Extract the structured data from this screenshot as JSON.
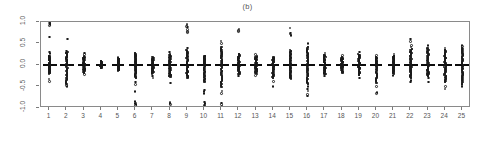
{
  "chart": {
    "title": "(b)",
    "type_label": "strip-chart"
  },
  "axes": {
    "y_ticks": [
      "1.0",
      "0.5",
      "0.0",
      "-0.5",
      "-1.0"
    ],
    "y_tick_values": [
      1.0,
      0.5,
      0.0,
      -0.5,
      -1.0
    ],
    "x_ticks": [
      "1",
      "2",
      "3",
      "4",
      "5",
      "6",
      "7",
      "8",
      "9",
      "10",
      "11",
      "12",
      "13",
      "14",
      "15",
      "16",
      "17",
      "18",
      "19",
      "20",
      "21",
      "22",
      "23",
      "24",
      "25"
    ]
  },
  "colors": {
    "point": "#1a1a1a",
    "frame": "#8a8a8a",
    "text": "#555555",
    "background": "#ffffff"
  },
  "chart_data": {
    "type": "scatter",
    "title": "(b)",
    "xlabel": "",
    "ylabel": "",
    "xlim": [
      0.5,
      25.5
    ],
    "ylim": [
      -1.0,
      1.0
    ],
    "grid": false,
    "legend": "none",
    "categories": [
      "1",
      "2",
      "3",
      "4",
      "5",
      "6",
      "7",
      "8",
      "9",
      "10",
      "11",
      "12",
      "13",
      "14",
      "15",
      "16",
      "17",
      "18",
      "19",
      "20",
      "21",
      "22",
      "23",
      "24",
      "25"
    ],
    "groups": [
      {
        "x": 1,
        "center": 0.0,
        "dense_min": -0.2,
        "dense_max": 0.22,
        "bar_half_width": 7,
        "outliers": [
          1.0,
          0.98,
          0.96,
          0.94,
          0.92,
          0.65,
          0.3,
          0.27,
          -0.33,
          -0.38
        ]
      },
      {
        "x": 2,
        "center": 0.0,
        "dense_min": -0.45,
        "dense_max": 0.3,
        "bar_half_width": 7,
        "outliers": [
          0.6,
          0.33,
          0.28,
          -0.48,
          -0.5
        ]
      },
      {
        "x": 3,
        "center": 0.0,
        "dense_min": -0.18,
        "dense_max": 0.2,
        "bar_half_width": 6,
        "outliers": [
          0.28,
          0.25,
          -0.22
        ]
      },
      {
        "x": 4,
        "center": 0.0,
        "dense_min": -0.08,
        "dense_max": 0.09,
        "bar_half_width": 5,
        "outliers": []
      },
      {
        "x": 5,
        "center": 0.0,
        "dense_min": -0.13,
        "dense_max": 0.15,
        "bar_half_width": 6,
        "outliers": [
          0.18
        ]
      },
      {
        "x": 6,
        "center": 0.0,
        "dense_min": -0.3,
        "dense_max": 0.28,
        "bar_half_width": 7,
        "outliers": [
          -0.4,
          -0.45,
          -0.62,
          -0.85,
          -0.88,
          -0.9,
          -0.92,
          -0.94
        ]
      },
      {
        "x": 7,
        "center": 0.0,
        "dense_min": -0.2,
        "dense_max": 0.18,
        "bar_half_width": 6,
        "outliers": [
          -0.26,
          -0.3
        ]
      },
      {
        "x": 8,
        "center": 0.0,
        "dense_min": -0.28,
        "dense_max": 0.25,
        "bar_half_width": 7,
        "outliers": [
          0.3,
          -0.42,
          -0.86,
          -0.88,
          -0.9,
          -0.92
        ]
      },
      {
        "x": 9,
        "center": 0.0,
        "dense_min": -0.3,
        "dense_max": 0.35,
        "bar_half_width": 7,
        "outliers": [
          0.95,
          0.93,
          0.9,
          0.88,
          0.82,
          0.78,
          0.75,
          0.4,
          -0.28
        ]
      },
      {
        "x": 10,
        "center": 0.0,
        "dense_min": -0.4,
        "dense_max": 0.22,
        "bar_half_width": 7,
        "outliers": [
          -0.58,
          -0.62,
          -0.66,
          -0.86,
          -0.9,
          -0.93,
          -0.95
        ]
      },
      {
        "x": 11,
        "center": 0.0,
        "dense_min": -0.52,
        "dense_max": 0.42,
        "bar_half_width": 7,
        "outliers": [
          0.56,
          0.5,
          -0.6,
          -0.66,
          -0.88,
          -0.92,
          -0.95
        ]
      },
      {
        "x": 12,
        "center": 0.0,
        "dense_min": -0.22,
        "dense_max": 0.26,
        "bar_half_width": 7,
        "outliers": [
          0.84,
          0.8,
          0.78,
          -0.26
        ]
      },
      {
        "x": 13,
        "center": 0.0,
        "dense_min": -0.2,
        "dense_max": 0.2,
        "bar_half_width": 6,
        "outliers": [
          0.24,
          -0.24
        ]
      },
      {
        "x": 14,
        "center": 0.0,
        "dense_min": -0.3,
        "dense_max": 0.18,
        "bar_half_width": 6,
        "outliers": [
          -0.38,
          -0.5
        ]
      },
      {
        "x": 15,
        "center": 0.0,
        "dense_min": -0.32,
        "dense_max": 0.34,
        "bar_half_width": 7,
        "outliers": [
          0.86,
          0.74,
          0.72,
          0.7,
          0.68,
          -0.22
        ]
      },
      {
        "x": 16,
        "center": 0.0,
        "dense_min": -0.45,
        "dense_max": 0.42,
        "bar_half_width": 7,
        "outliers": [
          0.5,
          -0.5,
          -0.56,
          -0.6,
          -0.68,
          -0.72
        ]
      },
      {
        "x": 17,
        "center": 0.0,
        "dense_min": -0.22,
        "dense_max": 0.24,
        "bar_half_width": 6,
        "outliers": [
          0.28,
          -0.26
        ]
      },
      {
        "x": 18,
        "center": 0.0,
        "dense_min": -0.18,
        "dense_max": 0.18,
        "bar_half_width": 6,
        "outliers": [
          0.22
        ]
      },
      {
        "x": 19,
        "center": 0.0,
        "dense_min": -0.24,
        "dense_max": 0.25,
        "bar_half_width": 7,
        "outliers": [
          0.3,
          -0.3
        ]
      },
      {
        "x": 20,
        "center": 0.0,
        "dense_min": -0.42,
        "dense_max": 0.18,
        "bar_half_width": 6,
        "outliers": [
          0.22,
          -0.5,
          -0.64,
          -0.66
        ]
      },
      {
        "x": 21,
        "center": 0.0,
        "dense_min": -0.2,
        "dense_max": 0.22,
        "bar_half_width": 6,
        "outliers": [
          0.26,
          -0.24
        ]
      },
      {
        "x": 22,
        "center": 0.0,
        "dense_min": -0.3,
        "dense_max": 0.38,
        "bar_half_width": 7,
        "outliers": [
          0.6,
          0.55,
          0.45,
          0.42,
          -0.36,
          -0.4
        ]
      },
      {
        "x": 23,
        "center": 0.0,
        "dense_min": -0.26,
        "dense_max": 0.4,
        "bar_half_width": 7,
        "outliers": [
          0.46,
          -0.3,
          -0.4
        ]
      },
      {
        "x": 24,
        "center": 0.0,
        "dense_min": -0.4,
        "dense_max": 0.36,
        "bar_half_width": 7,
        "outliers": [
          0.4,
          -0.5,
          -0.56
        ]
      },
      {
        "x": 25,
        "center": 0.0,
        "dense_min": -0.42,
        "dense_max": 0.4,
        "bar_half_width": 7,
        "outliers": [
          0.45,
          0.43,
          -0.46,
          -0.5
        ]
      }
    ]
  }
}
